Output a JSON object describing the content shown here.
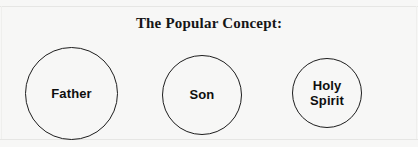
{
  "diagram": {
    "title": "The Popular Concept:",
    "background_color": "#f7f7f6",
    "stroke_color": "#1d1d1d",
    "text_color": "#0e0e0e",
    "nodes": [
      {
        "id": "father",
        "label": "Father",
        "shape": "circle"
      },
      {
        "id": "son",
        "label": "Son",
        "shape": "circle"
      },
      {
        "id": "holy_spirit",
        "label": "Holy\nSpirit",
        "shape": "circle"
      }
    ]
  }
}
